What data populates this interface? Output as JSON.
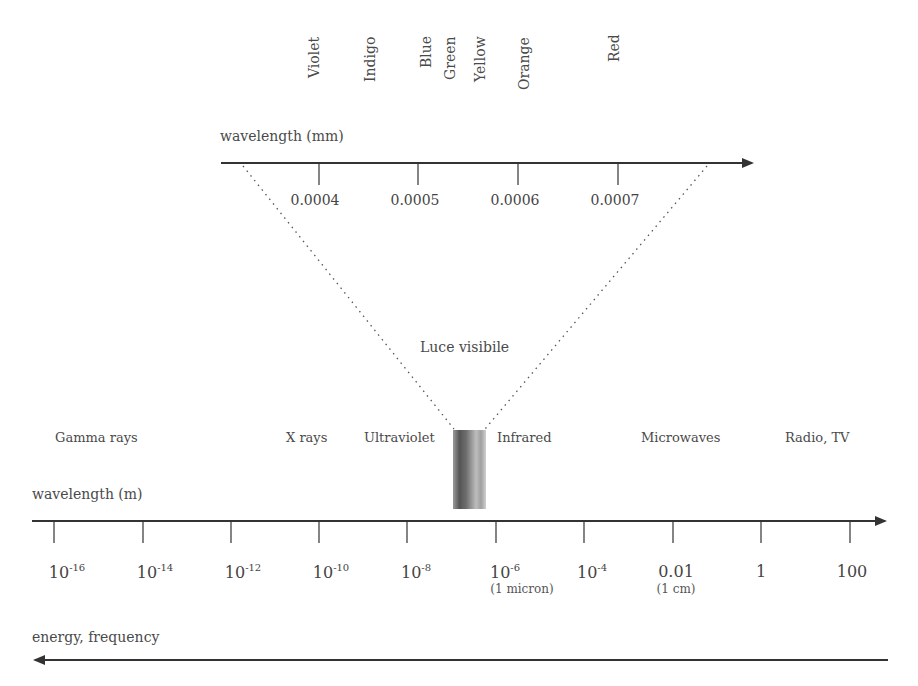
{
  "visible_colors": [
    "Violet",
    "Indigo",
    "Blue",
    "Green",
    "Yellow",
    "Orange",
    "Red"
  ],
  "top_axis": {
    "label": "wavelength (mm)",
    "ticks": [
      "0.0004",
      "0.0005",
      "0.0006",
      "0.0007"
    ]
  },
  "visible_label": "Luce visibile",
  "regions": [
    "Gamma rays",
    "X rays",
    "Ultraviolet",
    "Infrared",
    "Microwaves",
    "Radio, TV"
  ],
  "bottom_axis": {
    "label": "wavelength (m)",
    "ticks": [
      {
        "base": "10",
        "exp": "-16",
        "note": ""
      },
      {
        "base": "10",
        "exp": "-14",
        "note": ""
      },
      {
        "base": "10",
        "exp": "-12",
        "note": ""
      },
      {
        "base": "10",
        "exp": "-10",
        "note": ""
      },
      {
        "base": "10",
        "exp": "-8",
        "note": ""
      },
      {
        "base": "10",
        "exp": "-6",
        "note": "(1 micron)"
      },
      {
        "base": "10",
        "exp": "-4",
        "note": ""
      },
      {
        "base": "0.01",
        "exp": "",
        "note": "(1 cm)"
      },
      {
        "base": "1",
        "exp": "",
        "note": ""
      },
      {
        "base": "100",
        "exp": "",
        "note": ""
      }
    ]
  },
  "energy_axis": {
    "label": "energy, frequency"
  },
  "colors": {
    "line": "#333333",
    "text": "#4a4a4a",
    "background": "#ffffff"
  }
}
